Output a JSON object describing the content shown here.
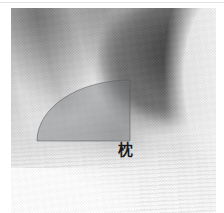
{
  "figure": {
    "kind": "grayscale-anatomical-photograph",
    "width": 224,
    "height": 213,
    "background_color": "#ffffff",
    "plate": {
      "left": 11,
      "top": 8,
      "width": 205,
      "height": 205,
      "tone_light": "#e6e6e6",
      "tone_mid": "#c4c4c4",
      "tone_dark": "#3a3a3a"
    }
  },
  "annotation": {
    "sector": {
      "name": "quarter-circle-highlight",
      "apex_x": 130,
      "apex_y": 80,
      "left_tip_x": 37,
      "left_tip_y": 141,
      "bottom_right_x": 130,
      "bottom_right_y": 141,
      "fill_color": "#6f7276",
      "fill_opacity": 0.42,
      "stroke_color": "#55585c",
      "stroke_opacity": 0.55,
      "stroke_width": 1
    },
    "label": {
      "text": "枕",
      "reading": "makura",
      "meaning": "pillow",
      "color": "#1b1b1b",
      "x": 118,
      "y": 142,
      "font_size_px": 15
    }
  },
  "decor": {
    "top_rule_color": "#e3e3e3",
    "white_block_color": "#ffffff"
  }
}
